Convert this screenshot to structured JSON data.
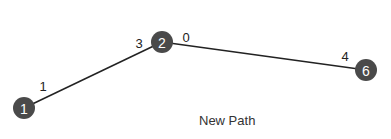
{
  "diagram": {
    "caption": "New Path",
    "colors": {
      "node_fill": "#4a4a4a",
      "node_text": "#ffffff",
      "edge": "#222222"
    },
    "nodes": [
      {
        "id": "1",
        "label": "1",
        "x": 24,
        "y": 108
      },
      {
        "id": "2",
        "label": "2",
        "x": 162,
        "y": 42
      },
      {
        "id": "6",
        "label": "6",
        "x": 366,
        "y": 70
      }
    ],
    "edges": [
      {
        "from": "1",
        "to": "2",
        "from_port": "1",
        "to_port": "3"
      },
      {
        "from": "2",
        "to": "6",
        "from_port": "0",
        "to_port": "4"
      }
    ],
    "port_labels": [
      {
        "text": "1",
        "x": 43,
        "y": 86
      },
      {
        "text": "3",
        "x": 139,
        "y": 43
      },
      {
        "text": "0",
        "x": 186,
        "y": 37
      },
      {
        "text": "4",
        "x": 345,
        "y": 56
      }
    ]
  }
}
